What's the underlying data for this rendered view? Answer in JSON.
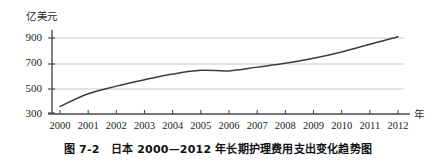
{
  "chart_data": {
    "type": "line",
    "title": "图 7-2　日本 2000—2012 年长期护理费用支出变化趋势图",
    "xlabel": "年",
    "ylabel": "亿美元",
    "grid": true,
    "legend": "none",
    "xlim": [
      2000,
      2012
    ],
    "ylim": [
      300,
      960
    ],
    "xticks": [
      "2000",
      "2001",
      "2002",
      "2003",
      "2004",
      "2005",
      "2006",
      "2007",
      "2008",
      "2009",
      "2010",
      "2011",
      "2012"
    ],
    "yticks": [
      "300",
      "500",
      "700",
      "900"
    ],
    "x": [
      2000,
      2001,
      2002,
      2003,
      2004,
      2005,
      2006,
      2007,
      2008,
      2009,
      2010,
      2011,
      2012
    ],
    "values": [
      360,
      460,
      520,
      570,
      615,
      645,
      640,
      670,
      700,
      740,
      790,
      850,
      910
    ],
    "series": [
      {
        "name": "日本长期护理费用支出",
        "values": [
          360,
          460,
          520,
          570,
          615,
          645,
          640,
          670,
          700,
          740,
          790,
          850,
          910
        ]
      }
    ],
    "line_color": "#3c3c3c",
    "grid_color": "#c9c9c9",
    "axis_color": "#4a4a4a"
  },
  "caption": {
    "figure_number": "图 7-2",
    "text": "日本 2000—2012 年长期护理费用支出变化趋势图",
    "full": "图 7-2　日本 2000—2012 年长期护理费用支出变化趋势图"
  },
  "axes": {
    "y_unit": "亿美元",
    "x_unit": "年"
  }
}
